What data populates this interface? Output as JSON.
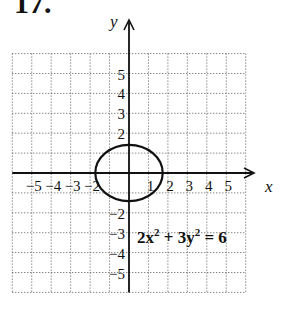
{
  "problem_number": "17.",
  "chart_data": {
    "type": "line",
    "title": "17.",
    "xlabel": "x",
    "ylabel": "y",
    "xlim": [
      -6,
      6
    ],
    "ylim": [
      -6,
      6
    ],
    "grid": true,
    "grid_style": "dotted",
    "x_tick_labels": [
      "-5",
      "-4",
      "-3",
      "-2",
      "1",
      "2",
      "3",
      "4",
      "5"
    ],
    "x_ticks": [
      -5,
      -4,
      -3,
      -2,
      1,
      2,
      3,
      4,
      5
    ],
    "y_tick_labels": [
      "5",
      "4",
      "3",
      "2",
      "-2",
      "-3",
      "-4",
      "-5"
    ],
    "y_ticks": [
      5,
      4,
      3,
      2,
      -2,
      -3,
      -4,
      -5
    ],
    "series": [
      {
        "name": "2x^2 + 3y^2 = 6",
        "shape": "ellipse",
        "center": [
          0,
          0
        ],
        "semi_axis_x": 1.732,
        "semi_axis_y": 1.414
      }
    ],
    "annotations": [
      {
        "text": "2x² + 3y² = 6",
        "x": 0.5,
        "y": -3
      }
    ]
  },
  "labels": {
    "x_axis": "x",
    "y_axis": "y",
    "equation_base1": "2x",
    "equation_sup1": "2",
    "equation_base2": " + 3y",
    "equation_sup2": "2",
    "equation_tail": " = 6"
  }
}
